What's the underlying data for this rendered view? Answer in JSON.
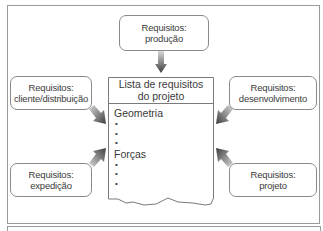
{
  "diagram": {
    "center": {
      "title_line1": "Lista de requisitos",
      "title_line2": "do projeto",
      "sections": [
        {
          "label": "Geometria",
          "bullets": [
            "•",
            "•",
            "•"
          ]
        },
        {
          "label": "Forças",
          "bullets": [
            "•",
            "•",
            "•"
          ]
        }
      ]
    },
    "inputs": {
      "producao": {
        "line1": "Requisitos:",
        "line2": "produção",
        "position": "top"
      },
      "cliente": {
        "line1": "Requisitos:",
        "line2": "cliente/distribuição",
        "position": "top-left"
      },
      "desenvolvimento": {
        "line1": "Requisitos:",
        "line2": "desenvolvimento",
        "position": "top-right"
      },
      "expedicao": {
        "line1": "Requisitos:",
        "line2": "expedição",
        "position": "bottom-left"
      },
      "projeto": {
        "line1": "Requisitos:",
        "line2": "projeto",
        "position": "bottom-right"
      }
    },
    "colors": {
      "arrow": "#4a4a4a",
      "border": "#8a8a8a"
    }
  }
}
